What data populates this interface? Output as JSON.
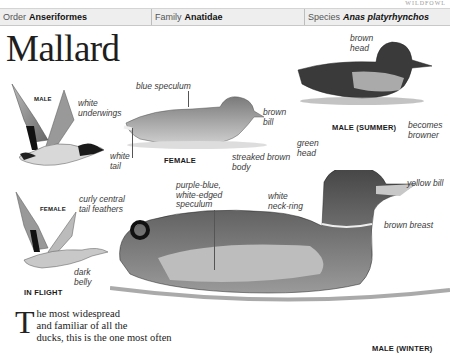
{
  "running_head": "WILDFOWL",
  "taxonomy": {
    "order_label": "Order",
    "order_value": "Anseriformes",
    "family_label": "Family",
    "family_value": "Anatidae",
    "species_label": "Species",
    "species_value": "Anas platyrhynchos"
  },
  "title": "Mallard",
  "figures": {
    "male_flight": {
      "caption": "MALE",
      "labels": {
        "underwings": "white\nunderwings"
      }
    },
    "female_swim": {
      "caption": "FEMALE",
      "labels": {
        "speculum": "blue speculum",
        "bill": "brown\nbill",
        "tail": "white\ntail",
        "body": "streaked brown\nbody"
      }
    },
    "male_summer": {
      "caption": "MALE (SUMMER)",
      "labels": {
        "head": "brown\nhead",
        "browner": "becomes\nbrowner"
      }
    },
    "female_flight": {
      "caption": "FEMALE",
      "caption2": "IN FLIGHT",
      "labels": {
        "belly": "dark\nbelly"
      }
    },
    "male_winter": {
      "caption": "MALE (WINTER)",
      "labels": {
        "tail_feathers": "curly central\ntail feathers",
        "speculum": "purple-blue,\nwhite-edged\nspeculum",
        "green_head": "green\nhead",
        "yellow_bill": "yellow bill",
        "neck_ring": "white\nneck-ring",
        "breast": "brown breast"
      }
    }
  },
  "body": {
    "dropcap": "T",
    "line1": "he most widespread",
    "line2": "and familiar of all the",
    "line3": "ducks, this is the one most often"
  },
  "colors": {
    "bar_bg": "#eeeeee",
    "text": "#1a1a1a",
    "label": "#3a3a3a"
  }
}
